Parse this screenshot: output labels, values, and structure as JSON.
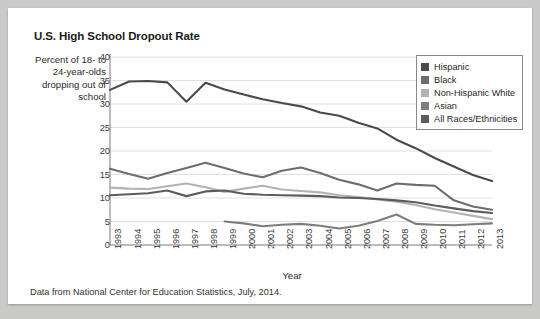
{
  "card": {
    "title": "U.S. High School Dropout Rate",
    "y_axis_caption": "Percent of 18- to 24-year-olds dropping out of school",
    "caption": "Data from National Center for Education Statistics, July, 2014."
  },
  "legend": {
    "position": "top-right",
    "items": [
      {
        "label": "Hispanic",
        "color": "#4a4a4a"
      },
      {
        "label": "Black",
        "color": "#6d6d6d"
      },
      {
        "label": "Non-Hispanic White",
        "color": "#b3b3b3"
      },
      {
        "label": "Asian",
        "color": "#7d7d7d"
      },
      {
        "label": "All Races/Ethnicities",
        "color": "#5c5c5c"
      }
    ]
  },
  "chart_data": {
    "type": "line",
    "title": "U.S. High School Dropout Rate",
    "xlabel": "Year",
    "ylabel": "Percent of 18- to 24-year-olds dropping out of school",
    "xlim": [
      1993,
      2013
    ],
    "ylim": [
      0,
      40
    ],
    "yticks": [
      0,
      5,
      10,
      15,
      20,
      25,
      30,
      35,
      40
    ],
    "grid": true,
    "categories": [
      1993,
      1994,
      1995,
      1996,
      1997,
      1998,
      1999,
      2000,
      2001,
      2002,
      2003,
      2004,
      2005,
      2006,
      2007,
      2008,
      2009,
      2010,
      2011,
      2012,
      2013
    ],
    "series": [
      {
        "name": "Hispanic",
        "color": "#4a4a4a",
        "values": [
          33.0,
          34.8,
          34.9,
          34.6,
          30.5,
          34.5,
          33.1,
          32.0,
          31.0,
          30.2,
          29.5,
          28.2,
          27.5,
          26.0,
          24.8,
          22.4,
          20.6,
          18.5,
          16.7,
          14.9,
          13.6
        ]
      },
      {
        "name": "Black",
        "color": "#6d6d6d",
        "values": [
          16.2,
          15.1,
          14.1,
          15.3,
          16.4,
          17.5,
          16.4,
          15.2,
          14.4,
          15.8,
          16.5,
          15.3,
          13.9,
          12.9,
          11.6,
          13.1,
          12.8,
          12.6,
          9.5,
          8.2,
          7.5
        ]
      },
      {
        "name": "Non-Hispanic White",
        "color": "#b3b3b3",
        "values": [
          12.2,
          12.0,
          11.9,
          12.5,
          13.1,
          12.3,
          11.3,
          12.0,
          12.6,
          11.8,
          11.5,
          11.2,
          10.6,
          10.2,
          9.7,
          9.2,
          8.5,
          7.6,
          6.9,
          6.2,
          5.5
        ]
      },
      {
        "name": "Asian",
        "color": "#7d7d7d",
        "values": [
          null,
          null,
          null,
          null,
          null,
          null,
          5.0,
          4.6,
          4.0,
          4.3,
          4.5,
          4.1,
          3.5,
          4.1,
          5.1,
          6.5,
          4.5,
          4.3,
          4.2,
          4.4,
          4.6
        ]
      },
      {
        "name": "All Races/Ethnicities",
        "color": "#5c5c5c",
        "values": [
          10.6,
          10.8,
          11.0,
          11.6,
          10.4,
          11.4,
          11.6,
          10.9,
          10.7,
          10.6,
          10.5,
          10.4,
          10.1,
          10.0,
          9.8,
          9.5,
          9.1,
          8.4,
          7.8,
          7.2,
          6.8
        ]
      }
    ]
  }
}
